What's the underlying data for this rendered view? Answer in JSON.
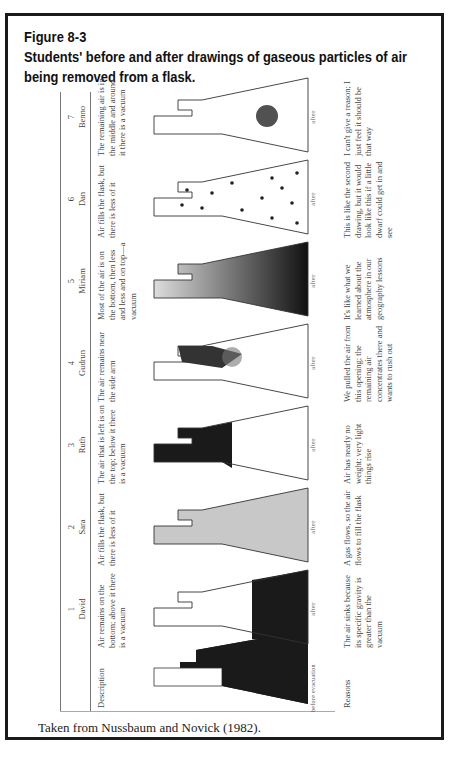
{
  "figure": {
    "label": "Figure 8-3",
    "title": "Students' before and after drawings of gaseous particles of air being removed from a flask.",
    "caption": "Taken from Nussbaum and Novick (1982)."
  },
  "table": {
    "row_labels": {
      "description": "Description",
      "reasons": "Reasons"
    },
    "before_label": "before evacuation",
    "after_label": "after",
    "students": [
      {
        "num": "1",
        "name": "David",
        "description": "Air remains on the bottom; above it there is a vacuum",
        "reason": "The air sinks because its specific gravity is greater than the vacuum",
        "drawing": "bottom-filled"
      },
      {
        "num": "2",
        "name": "Sara",
        "description": "Air fills the flask, but there is less of it",
        "reason": "A gas flows, so the air flows to fill the flask",
        "drawing": "uniform-light"
      },
      {
        "num": "3",
        "name": "Ruth",
        "description": "The air that is left is on the top; below it there is a vacuum",
        "reason": "Air has nearly no weight; very light things rise",
        "drawing": "top-filled"
      },
      {
        "num": "4",
        "name": "Gudrun",
        "description": "The air remains near the side arm",
        "reason": "We pulled the air from this opening; the remaining air concentrates there and wants to rush out",
        "drawing": "near-side-arm"
      },
      {
        "num": "5",
        "name": "Miriam",
        "description": "Most of the air is on the bottom, then less and less and on top—a vacuum",
        "reason": "It's like what we learned about the atmosphere in our geography lessons",
        "drawing": "gradient"
      },
      {
        "num": "6",
        "name": "Dan",
        "description": "Air fills the flask, but there is less of it",
        "reason": "This is like the second drawing, but it would look like this if a little dwarf could get in and see",
        "drawing": "sparse-particles"
      },
      {
        "num": "7",
        "name": "Benno",
        "description": "The remaining air is in the middle and around it there is a vacuum",
        "reason": "I can't give a reason; I just feel it should be that way",
        "drawing": "middle-cluster"
      }
    ]
  }
}
